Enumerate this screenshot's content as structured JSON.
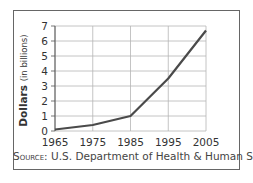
{
  "chart_data": {
    "type": "line",
    "title": "",
    "xlabel": "",
    "ylabel": "Dollars (in billions)",
    "ylabel_bold": "Dollars",
    "ylabel_rest": "(in billions)",
    "categories": [
      "1965",
      "1975",
      "1985",
      "1995",
      "2005"
    ],
    "x": [
      1965,
      1975,
      1985,
      1995,
      2005
    ],
    "series": [
      {
        "name": "Spending",
        "values": [
          0.1,
          0.4,
          1.0,
          3.5,
          6.7
        ]
      }
    ],
    "ylim": [
      0,
      7
    ],
    "yticks": [
      0,
      1,
      2,
      3,
      4,
      5,
      6,
      7
    ],
    "xlim": [
      1965,
      2005
    ],
    "grid": true,
    "legend": null,
    "source": "SOURCE: U.S. Department of Health & Human Services"
  },
  "source": {
    "label": "Source:",
    "text": "U.S. Department of Health & Human Services"
  },
  "colors": {
    "line": "#4a4a4a",
    "grid": "#b5b5b5",
    "axis": "#555555",
    "frame": "#666666",
    "text": "#333333"
  }
}
